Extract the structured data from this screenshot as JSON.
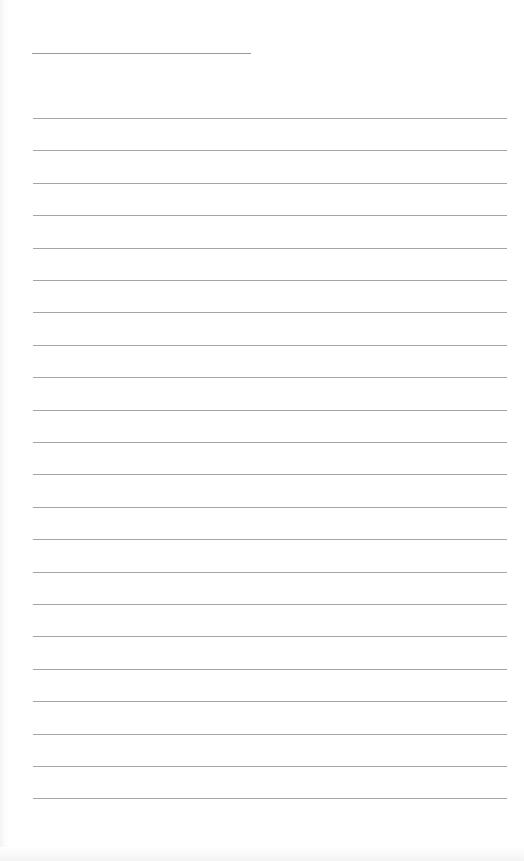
{
  "document": {
    "type": "lined-paper",
    "title_line": {
      "left": 32,
      "top": 53,
      "width": 219,
      "color": "#9a9a9a"
    },
    "rules": {
      "count": 22,
      "first_top": 118,
      "spacing": 32.4,
      "left": 33,
      "width": 474,
      "color": "#a6a6a6"
    },
    "background_color": "#ffffff"
  }
}
